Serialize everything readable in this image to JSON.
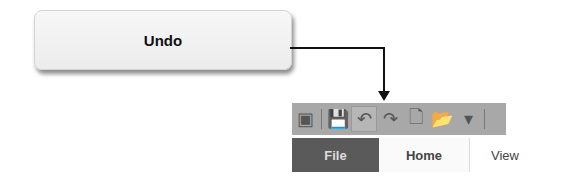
{
  "callout": {
    "label": "Undo"
  },
  "toolbar": {
    "items": [
      {
        "name": "app-icon",
        "glyph": "▣"
      },
      {
        "name": "save-icon",
        "glyph": "💾"
      },
      {
        "name": "undo-icon",
        "glyph": "↶"
      },
      {
        "name": "redo-icon",
        "glyph": "↷"
      },
      {
        "name": "new-document-icon",
        "glyph": "🗋"
      },
      {
        "name": "open-icon",
        "glyph": "📂"
      },
      {
        "name": "customize-dropdown-icon",
        "glyph": "▾"
      }
    ]
  },
  "tabs": [
    {
      "label": "File"
    },
    {
      "label": "Home"
    },
    {
      "label": "View"
    }
  ]
}
